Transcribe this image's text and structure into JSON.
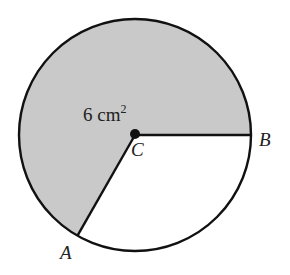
{
  "diagram": {
    "type": "circle-sector",
    "center_label": "C",
    "point_a_label": "A",
    "point_b_label": "B",
    "area_value": "6 cm",
    "area_exponent": "2",
    "colors": {
      "shaded_sector": "#c9c9c9",
      "unshaded_sector": "#ffffff",
      "stroke": "#111111"
    }
  }
}
